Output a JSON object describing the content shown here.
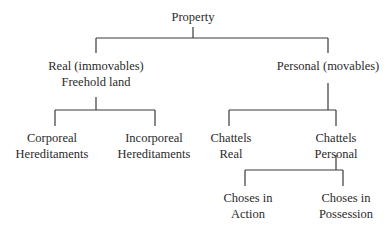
{
  "diagram": {
    "root": {
      "label": "Property"
    },
    "real": {
      "line1": "Real (immovables)",
      "line2": "Freehold land"
    },
    "personal": {
      "label": "Personal (movables)"
    },
    "corporeal": {
      "line1": "Corporeal",
      "line2": "Hereditaments"
    },
    "incorporeal": {
      "line1": "Incorporeal",
      "line2": "Hereditaments"
    },
    "chattels_real": {
      "line1": "Chattels",
      "line2": "Real"
    },
    "chattels_personal": {
      "line1": "Chattels",
      "line2": "Personal"
    },
    "choses_action": {
      "line1": "Choses in",
      "line2": "Action"
    },
    "choses_possession": {
      "line1": "Choses in",
      "line2": "Possession"
    }
  }
}
